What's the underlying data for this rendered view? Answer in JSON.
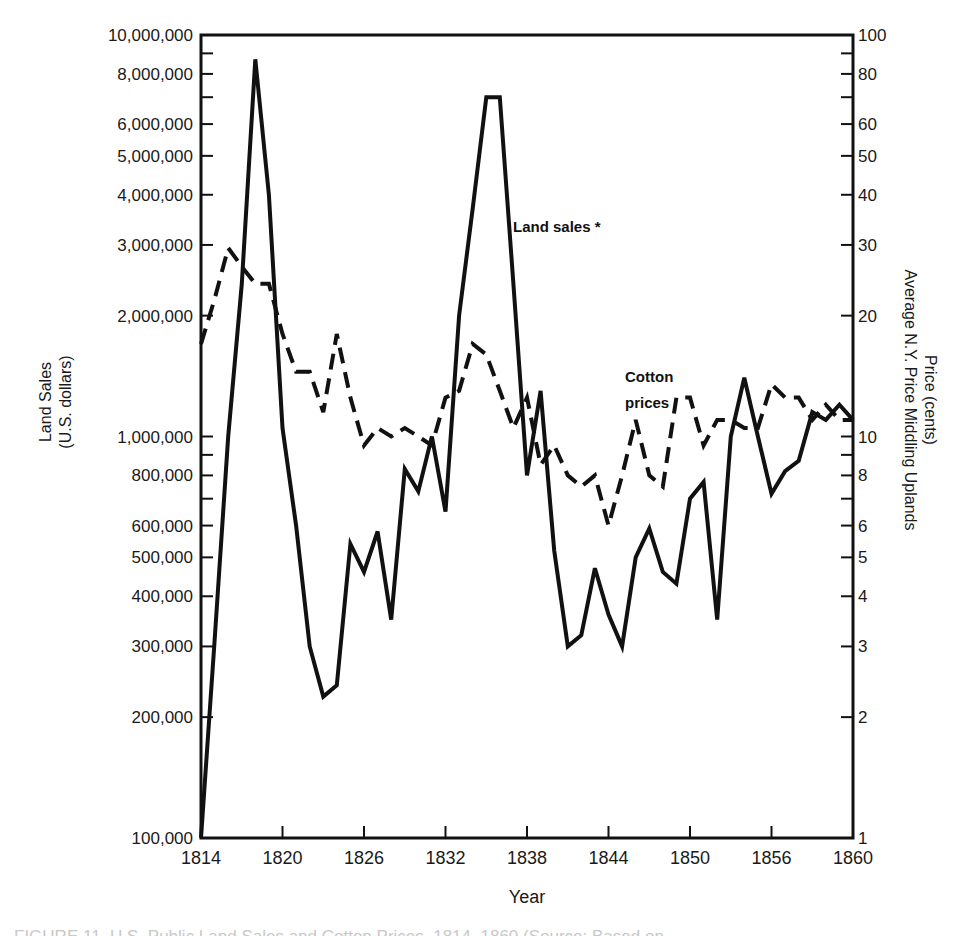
{
  "chart_data": {
    "type": "line",
    "title": "",
    "xlabel": "Year",
    "ylabel_left": "Land Sales (U.S. dollars)",
    "ylabel_left_lines": [
      "Land Sales",
      "(U.S. dollars)"
    ],
    "ylabel_right": "Price (cents) Average N.Y. Price Middling Uplands",
    "ylabel_right_lines": [
      "Price (cents)",
      "Average N.Y. Price Middling Uplands"
    ],
    "y_scale": "log",
    "ylim_left": [
      100000,
      10000000
    ],
    "ylim_right": [
      1,
      100
    ],
    "x_ticks": [
      "1814",
      "1820",
      "1826",
      "1832",
      "1838",
      "1844",
      "1850",
      "1856",
      "1860"
    ],
    "y_left_ticks": [
      {
        "value": 10000000,
        "label": "10,000,000"
      },
      {
        "value": 8000000,
        "label": "8,000,000"
      },
      {
        "value": 6000000,
        "label": "6,000,000"
      },
      {
        "value": 5000000,
        "label": "5,000,000"
      },
      {
        "value": 4000000,
        "label": "4,000,000"
      },
      {
        "value": 3000000,
        "label": "3,000,000"
      },
      {
        "value": 2000000,
        "label": "2,000,000"
      },
      {
        "value": 1000000,
        "label": "1,000,000"
      },
      {
        "value": 800000,
        "label": "800,000"
      },
      {
        "value": 600000,
        "label": "600,000"
      },
      {
        "value": 500000,
        "label": "500,000"
      },
      {
        "value": 400000,
        "label": "400,000"
      },
      {
        "value": 300000,
        "label": "300,000"
      },
      {
        "value": 200000,
        "label": "200,000"
      },
      {
        "value": 100000,
        "label": "100,000"
      }
    ],
    "y_left_minor_ticks": [
      9000000,
      7000000,
      900000,
      700000
    ],
    "y_right_ticks": [
      {
        "value": 100,
        "label": "100"
      },
      {
        "value": 80,
        "label": "80"
      },
      {
        "value": 60,
        "label": "60"
      },
      {
        "value": 50,
        "label": "50"
      },
      {
        "value": 40,
        "label": "40"
      },
      {
        "value": 30,
        "label": "30"
      },
      {
        "value": 20,
        "label": "20"
      },
      {
        "value": 10,
        "label": "10"
      },
      {
        "value": 8,
        "label": "8"
      },
      {
        "value": 6,
        "label": "6"
      },
      {
        "value": 5,
        "label": "5"
      },
      {
        "value": 4,
        "label": "4"
      },
      {
        "value": 3,
        "label": "3"
      },
      {
        "value": 2,
        "label": "2"
      },
      {
        "value": 1,
        "label": "1"
      }
    ],
    "y_right_minor_ticks": [
      90,
      70,
      9,
      7
    ],
    "grid": false,
    "legend": "inline annotations",
    "annotations": [
      {
        "text": "Land sales *",
        "series": "Land sales"
      },
      {
        "text": "Cotton",
        "series": "Cotton prices"
      },
      {
        "text": "prices",
        "series": "Cotton prices"
      }
    ],
    "x": [
      1814,
      1815,
      1816,
      1817,
      1818,
      1819,
      1820,
      1821,
      1822,
      1823,
      1824,
      1825,
      1826,
      1827,
      1828,
      1829,
      1830,
      1831,
      1832,
      1833,
      1834,
      1835,
      1836,
      1837,
      1838,
      1839,
      1840,
      1841,
      1842,
      1843,
      1844,
      1845,
      1846,
      1847,
      1848,
      1849,
      1850,
      1851,
      1852,
      1853,
      1854,
      1855,
      1856,
      1857,
      1858,
      1859,
      1860,
      1861,
      1862
    ],
    "series": [
      {
        "name": "Land sales",
        "axis": "left",
        "style": "solid",
        "values": [
          100000,
          310000,
          1000000,
          2400000,
          8700000,
          4000000,
          1050000,
          600000,
          300000,
          225000,
          240000,
          540000,
          460000,
          580000,
          350000,
          830000,
          730000,
          1000000,
          650000,
          2000000,
          3700000,
          7000000,
          7000000,
          2400000,
          800000,
          1300000,
          520000,
          300000,
          320000,
          470000,
          360000,
          300000,
          500000,
          590000,
          460000,
          430000,
          700000,
          770000,
          350000,
          1000000,
          1400000,
          1000000,
          720000,
          820000,
          870000,
          1150000,
          1100000,
          1200000,
          1100000
        ]
      },
      {
        "name": "Cotton prices",
        "axis": "right",
        "style": "dashed",
        "values": [
          17,
          22,
          29.5,
          26.5,
          24,
          24,
          18,
          14.5,
          14.5,
          11.5,
          18,
          12.5,
          9.5,
          10.5,
          10,
          10.5,
          10,
          9.5,
          12.5,
          13,
          17,
          16,
          13,
          10.5,
          12.5,
          8.5,
          9.5,
          8,
          7.5,
          8,
          6,
          8,
          11,
          8,
          7.5,
          12.5,
          12.5,
          9.5,
          11,
          11,
          10.5,
          10.5,
          13.5,
          12.5,
          12.5,
          11,
          12,
          11,
          11
        ]
      }
    ]
  },
  "caption": {
    "text": "FIGURE 11. U.S. Public Land Sales and Cotton Prices, 1814–1860 (Source: Based on..."
  }
}
